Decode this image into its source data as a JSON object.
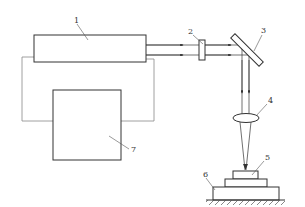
{
  "diagram": {
    "type": "schematic",
    "labels": [
      {
        "id": "1",
        "text": "1"
      },
      {
        "id": "2",
        "text": "2"
      },
      {
        "id": "3",
        "text": "3"
      },
      {
        "id": "4",
        "text": "4"
      },
      {
        "id": "5",
        "text": "5"
      },
      {
        "id": "6",
        "text": "6"
      },
      {
        "id": "7",
        "text": "7"
      }
    ],
    "colors": {
      "stroke": "#333333",
      "wire": "#777777",
      "background": "#ffffff"
    }
  }
}
